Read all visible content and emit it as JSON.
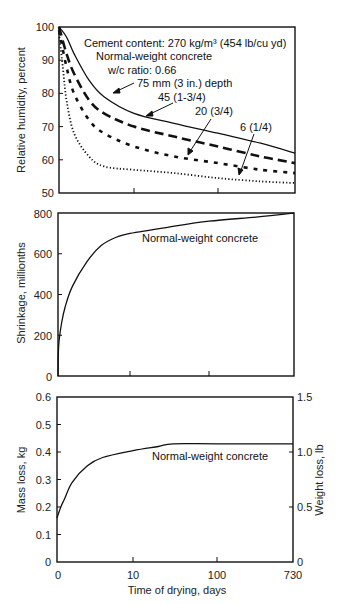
{
  "chart_data": [
    {
      "type": "line",
      "panel": "top",
      "ylabel": "Relative humidity, percent",
      "xlabel": "",
      "ylim": [
        50,
        100
      ],
      "yticks": [
        50,
        60,
        70,
        80,
        90,
        100
      ],
      "x_scale": "custom (0-10 linear, 10-730 log-like)",
      "xticks": [
        0,
        10,
        100,
        730
      ],
      "grid": false,
      "annotations": [
        "Cement content: 270 kg/m³ (454 lb/cu yd)",
        "Normal-weight concrete",
        "w/c ratio: 0.66"
      ],
      "series": [
        {
          "name": "75 mm (3 in.) depth",
          "style": "solid",
          "x": [
            0,
            1,
            2,
            4,
            6,
            10,
            30,
            100,
            300,
            730
          ],
          "values": [
            100,
            97,
            92,
            84,
            79,
            74,
            71,
            68,
            65,
            62
          ]
        },
        {
          "name": "45 (1-3/4)",
          "style": "long-dash",
          "x": [
            0,
            1,
            2,
            4,
            6,
            10,
            30,
            100,
            300,
            730
          ],
          "values": [
            100,
            92,
            86,
            78,
            74,
            70,
            67,
            64,
            61,
            59
          ]
        },
        {
          "name": "20 (3/4)",
          "style": "short-dash",
          "x": [
            0,
            1,
            2,
            4,
            6,
            10,
            30,
            100,
            300,
            730
          ],
          "values": [
            99,
            88,
            80,
            72,
            68,
            64,
            61,
            59,
            57,
            56
          ]
        },
        {
          "name": "6 (1/4)",
          "style": "dotted",
          "x": [
            0,
            0.5,
            1,
            2,
            4,
            6,
            10,
            30,
            100,
            300,
            730
          ],
          "values": [
            98,
            88,
            78,
            68,
            61,
            58,
            57,
            56,
            54.5,
            53.5,
            53
          ]
        }
      ]
    },
    {
      "type": "line",
      "panel": "middle",
      "ylabel": "Shrinkage, millionths",
      "xlabel": "",
      "ylim": [
        0,
        800
      ],
      "yticks": [
        0,
        200,
        400,
        600,
        800
      ],
      "xticks": [
        0,
        10,
        100,
        730
      ],
      "grid": false,
      "annotations": [
        "Normal-weight concrete"
      ],
      "series": [
        {
          "name": "Normal-weight concrete",
          "style": "solid",
          "x": [
            0,
            0.1,
            0.5,
            1,
            2,
            4,
            6,
            8,
            10,
            30,
            100,
            300,
            730
          ],
          "values": [
            0,
            150,
            260,
            340,
            440,
            560,
            640,
            680,
            700,
            730,
            760,
            780,
            800
          ]
        }
      ]
    },
    {
      "type": "line",
      "panel": "bottom",
      "ylabel": "Mass loss, kg",
      "ylabel_right": "Weight loss, lb",
      "xlabel": "Time of drying, days",
      "ylim": [
        0,
        0.6
      ],
      "ylim_right": [
        0,
        1.5
      ],
      "yticks": [
        0,
        0.1,
        0.2,
        0.3,
        0.4,
        0.5,
        0.6
      ],
      "yticks_right": [
        0,
        0.5,
        1.0,
        1.5
      ],
      "xticks": [
        0,
        10,
        100,
        730
      ],
      "grid": false,
      "annotations": [
        "Normal-weight concrete"
      ],
      "series": [
        {
          "name": "Normal-weight concrete",
          "style": "solid",
          "x": [
            0,
            0.5,
            1,
            2,
            4,
            6,
            10,
            20,
            30,
            100,
            730
          ],
          "values": [
            0.16,
            0.2,
            0.23,
            0.29,
            0.35,
            0.38,
            0.405,
            0.42,
            0.43,
            0.43,
            0.43
          ]
        }
      ]
    }
  ],
  "labels": {
    "top": {
      "ylabel": "Relative humidity, percent",
      "yticks": [
        "100",
        "90",
        "80",
        "70",
        "60",
        "50"
      ],
      "annot1": "Cement content: 270 kg/m³  (454 lb/cu yd)",
      "annot2": "Normal-weight concrete",
      "annot3": "w/c ratio: 0.66",
      "s75": "75 mm (3 in.) depth",
      "s45": "45 (1-3/4)",
      "s20": "20 (3/4)",
      "s6": "6 (1/4)"
    },
    "middle": {
      "ylabel": "Shrinkage, millionths",
      "yticks": [
        "800",
        "600",
        "400",
        "200",
        "0"
      ],
      "annot": "Normal-weight concrete"
    },
    "bottom": {
      "ylabel": "Mass loss, kg",
      "ylabel_right": "Weight loss, lb",
      "yticks": [
        "0.6",
        "0.5",
        "0.4",
        "0.3",
        "0.2",
        "0.1",
        "0"
      ],
      "yticks_right": [
        "1.5",
        "1.0",
        "0.5",
        "0"
      ],
      "xticks": [
        "0",
        "10",
        "100",
        "730"
      ],
      "xlabel": "Time of drying, days",
      "annot": "Normal-weight concrete"
    }
  }
}
